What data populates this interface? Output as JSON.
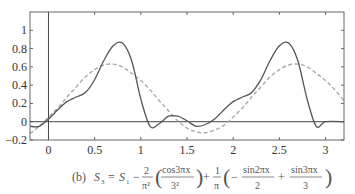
{
  "chart_data": {
    "type": "line",
    "title": "",
    "caption": "(b) S3 = S1 − (2/π²)(cos3πx / 3²) + (1/π)(−sin2πx / 2 + sin3πx / 3)",
    "xlabel": "",
    "ylabel": "",
    "xlim": [
      -0.2,
      3.2
    ],
    "ylim": [
      -0.2,
      1.2
    ],
    "xticks": [
      0,
      0.5,
      1,
      1.5,
      2,
      2.5,
      3
    ],
    "xtick_labels": [
      "0",
      "0.5",
      "1",
      "1.5",
      "2",
      "2.5",
      "3"
    ],
    "yticks": [
      -0.2,
      0,
      0.2,
      0.4,
      0.6,
      0.8,
      1
    ],
    "ytick_labels": [
      "−0.2",
      "0",
      "0.2",
      "0.4",
      "0.6",
      "0.8",
      "1"
    ],
    "grid": false,
    "legend": null,
    "series": [
      {
        "name": "S3",
        "style": "solid",
        "color": "#555555",
        "x": [
          -0.2,
          -0.1,
          0,
          0.1,
          0.2,
          0.3,
          0.4,
          0.5,
          0.6,
          0.7,
          0.8,
          0.9,
          1.0,
          1.1,
          1.2,
          1.3,
          1.4,
          1.5,
          1.6,
          1.7,
          1.8,
          1.9,
          2.0,
          2.1,
          2.2,
          2.3,
          2.4,
          2.5,
          2.6,
          2.7,
          2.8,
          2.9,
          3.0,
          3.2
        ],
        "y": [
          -0.05,
          -0.05,
          0.03,
          0.13,
          0.22,
          0.27,
          0.32,
          0.46,
          0.67,
          0.83,
          0.86,
          0.67,
          0.25,
          -0.05,
          -0.02,
          0.06,
          0.06,
          0.01,
          -0.05,
          -0.03,
          0.03,
          0.13,
          0.22,
          0.27,
          0.32,
          0.46,
          0.67,
          0.83,
          0.86,
          0.67,
          0.25,
          -0.05,
          0.0,
          0.0
        ]
      },
      {
        "name": "S1",
        "style": "dashed",
        "color": "#aaaaaa",
        "x": [
          -0.2,
          -0.1,
          0,
          0.1,
          0.2,
          0.3,
          0.4,
          0.5,
          0.6,
          0.7,
          0.8,
          0.9,
          1.0,
          1.1,
          1.2,
          1.3,
          1.4,
          1.5,
          1.6,
          1.7,
          1.8,
          1.9,
          2.0,
          2.1,
          2.2,
          2.3,
          2.4,
          2.5,
          2.6,
          2.7,
          2.8,
          2.9,
          3.0,
          3.1,
          3.2
        ],
        "y": [
          -0.13,
          -0.05,
          0.05,
          0.15,
          0.27,
          0.38,
          0.49,
          0.57,
          0.62,
          0.63,
          0.6,
          0.53,
          0.45,
          0.35,
          0.23,
          0.12,
          0.01,
          -0.07,
          -0.11,
          -0.12,
          -0.09,
          -0.04,
          0.05,
          0.15,
          0.27,
          0.38,
          0.49,
          0.57,
          0.62,
          0.63,
          0.6,
          0.53,
          0.45,
          0.35,
          0.23
        ]
      }
    ]
  },
  "caption_parts": {
    "label": "(b)",
    "lhs": "S",
    "lhs_sub": "3",
    "s1": "S",
    "s1_sub": "1",
    "frac1_num": "2",
    "frac1_den": "π²",
    "frac2_num": "cos3πx",
    "frac2_den": "3²",
    "frac3_num": "1",
    "frac3_den": "π",
    "frac4_num": "sin2πx",
    "frac4_den": "2",
    "frac5_num": "sin3πx",
    "frac5_den": "3"
  }
}
